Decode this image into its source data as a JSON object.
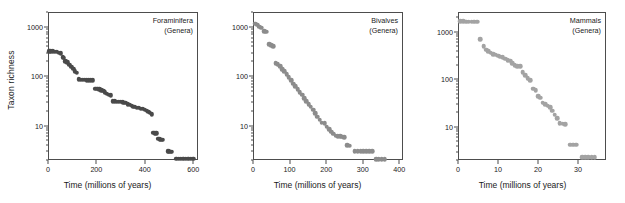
{
  "figure": {
    "shared_ylabel": "Taxon richness",
    "shared_xlabel": "Time (millions of years)"
  },
  "chart_data": [
    {
      "type": "scatter",
      "title": "Foraminifera",
      "subtitle": "(Genera)",
      "xlabel": "Time (millions of years)",
      "ylabel": "Taxon richness",
      "yscale": "log",
      "ylim": [
        2,
        2000
      ],
      "xlim": [
        0,
        620
      ],
      "yticks": [
        10,
        100,
        1000
      ],
      "ytick_labels": [
        "10",
        "100",
        "1000"
      ],
      "xticks": [
        0,
        200,
        400,
        600
      ],
      "xtick_labels": [
        "0",
        "200",
        "400",
        "600"
      ],
      "grid": false,
      "legend": "none",
      "marker_color": "#4a4a4a",
      "points": [
        [
          5,
          320
        ],
        [
          12,
          320
        ],
        [
          20,
          318
        ],
        [
          28,
          315
        ],
        [
          36,
          310
        ],
        [
          44,
          300
        ],
        [
          52,
          290
        ],
        [
          60,
          240
        ],
        [
          66,
          238
        ],
        [
          72,
          200
        ],
        [
          80,
          190
        ],
        [
          88,
          170
        ],
        [
          96,
          155
        ],
        [
          104,
          140
        ],
        [
          112,
          125
        ],
        [
          120,
          118
        ],
        [
          128,
          86
        ],
        [
          136,
          85
        ],
        [
          144,
          84
        ],
        [
          152,
          84
        ],
        [
          160,
          83
        ],
        [
          168,
          83
        ],
        [
          176,
          82
        ],
        [
          184,
          82
        ],
        [
          196,
          56
        ],
        [
          204,
          55
        ],
        [
          212,
          54
        ],
        [
          220,
          52
        ],
        [
          228,
          50
        ],
        [
          236,
          47
        ],
        [
          244,
          44
        ],
        [
          252,
          42
        ],
        [
          260,
          41
        ],
        [
          268,
          31
        ],
        [
          276,
          31
        ],
        [
          284,
          30
        ],
        [
          292,
          30
        ],
        [
          300,
          30
        ],
        [
          308,
          30
        ],
        [
          312,
          29
        ],
        [
          320,
          29
        ],
        [
          330,
          27
        ],
        [
          338,
          26
        ],
        [
          346,
          25
        ],
        [
          352,
          24
        ],
        [
          360,
          24
        ],
        [
          368,
          23
        ],
        [
          376,
          23
        ],
        [
          384,
          22
        ],
        [
          392,
          22
        ],
        [
          400,
          21
        ],
        [
          408,
          20
        ],
        [
          414,
          19
        ],
        [
          420,
          18
        ],
        [
          428,
          17
        ],
        [
          436,
          7.1
        ],
        [
          442,
          7.0
        ],
        [
          448,
          6.9
        ],
        [
          456,
          5.4
        ],
        [
          462,
          5.3
        ],
        [
          468,
          5.2
        ],
        [
          474,
          5.1
        ],
        [
          494,
          3.0
        ],
        [
          500,
          3.0
        ],
        [
          506,
          2.9
        ],
        [
          512,
          2.9
        ],
        [
          530,
          2.1
        ],
        [
          540,
          2.1
        ],
        [
          550,
          2.1
        ],
        [
          560,
          2.1
        ],
        [
          570,
          2.1
        ],
        [
          580,
          2.1
        ],
        [
          590,
          2.1
        ],
        [
          600,
          2.1
        ]
      ]
    },
    {
      "type": "scatter",
      "title": "Bivalves",
      "subtitle": "(Genera)",
      "xlabel": "Time (millions of years)",
      "ylabel": "Taxon richness",
      "yscale": "log",
      "ylim": [
        2,
        2000
      ],
      "xlim": [
        0,
        410
      ],
      "yticks": [
        10,
        100,
        1000
      ],
      "ytick_labels": [
        "10",
        "100",
        "1000"
      ],
      "xticks": [
        0,
        100,
        200,
        300,
        400
      ],
      "xtick_labels": [
        "0",
        "100",
        "200",
        "300",
        "400"
      ],
      "grid": false,
      "legend": "none",
      "marker_color": "#8c8c8c",
      "points": [
        [
          6,
          1150
        ],
        [
          12,
          1100
        ],
        [
          17,
          1000
        ],
        [
          22,
          960
        ],
        [
          30,
          820
        ],
        [
          36,
          790
        ],
        [
          45,
          450
        ],
        [
          50,
          430
        ],
        [
          56,
          410
        ],
        [
          62,
          185
        ],
        [
          68,
          175
        ],
        [
          74,
          160
        ],
        [
          80,
          140
        ],
        [
          86,
          125
        ],
        [
          92,
          110
        ],
        [
          98,
          95
        ],
        [
          104,
          82
        ],
        [
          110,
          70
        ],
        [
          116,
          62
        ],
        [
          122,
          55
        ],
        [
          128,
          48
        ],
        [
          134,
          42
        ],
        [
          140,
          36
        ],
        [
          146,
          31
        ],
        [
          152,
          27
        ],
        [
          158,
          24
        ],
        [
          164,
          21
        ],
        [
          170,
          18
        ],
        [
          176,
          15
        ],
        [
          182,
          13
        ],
        [
          188,
          11.5
        ],
        [
          196,
          11.0
        ],
        [
          202,
          9.5
        ],
        [
          208,
          8.5
        ],
        [
          214,
          7.5
        ],
        [
          220,
          6.8
        ],
        [
          226,
          6.2
        ],
        [
          232,
          6.0
        ],
        [
          238,
          6.0
        ],
        [
          244,
          5.9
        ],
        [
          250,
          5.8
        ],
        [
          258,
          4.0
        ],
        [
          264,
          3.9
        ],
        [
          278,
          3.0
        ],
        [
          286,
          3.0
        ],
        [
          294,
          3.0
        ],
        [
          302,
          3.0
        ],
        [
          310,
          3.0
        ],
        [
          318,
          3.0
        ],
        [
          326,
          3.0
        ],
        [
          336,
          2.1
        ],
        [
          344,
          2.1
        ],
        [
          352,
          2.1
        ],
        [
          360,
          2.1
        ]
      ]
    },
    {
      "type": "scatter",
      "title": "Mammals",
      "subtitle": "(Genera)",
      "xlabel": "Time (millions of years)",
      "ylabel": "Taxon richness",
      "yscale": "log",
      "ylim": [
        2,
        2600
      ],
      "xlim": [
        0,
        37
      ],
      "yticks": [
        10,
        100,
        1000
      ],
      "ytick_labels": [
        "10",
        "100",
        "1000"
      ],
      "xticks": [
        0,
        10,
        20,
        30
      ],
      "xtick_labels": [
        "0",
        "10",
        "20",
        "30"
      ],
      "grid": false,
      "legend": "none",
      "marker_color": "#a3a3a3",
      "points": [
        [
          0.6,
          1650
        ],
        [
          1.3,
          1650
        ],
        [
          2.0,
          1640
        ],
        [
          2.7,
          1640
        ],
        [
          3.4,
          1630
        ],
        [
          4.1,
          1630
        ],
        [
          4.8,
          1620
        ],
        [
          5.6,
          700
        ],
        [
          6.4,
          490
        ],
        [
          7.0,
          420
        ],
        [
          7.6,
          390
        ],
        [
          8.2,
          360
        ],
        [
          8.8,
          340
        ],
        [
          9.4,
          330
        ],
        [
          10.0,
          310
        ],
        [
          10.6,
          300
        ],
        [
          11.2,
          290
        ],
        [
          11.8,
          270
        ],
        [
          12.4,
          255
        ],
        [
          13.0,
          245
        ],
        [
          13.6,
          215
        ],
        [
          14.2,
          200
        ],
        [
          14.8,
          190
        ],
        [
          15.6,
          190
        ],
        [
          16.2,
          140
        ],
        [
          16.8,
          120
        ],
        [
          17.4,
          105
        ],
        [
          18.0,
          95
        ],
        [
          18.8,
          63
        ],
        [
          19.4,
          58
        ],
        [
          20.0,
          44
        ],
        [
          20.6,
          41
        ],
        [
          21.2,
          32
        ],
        [
          21.8,
          30
        ],
        [
          22.4,
          28
        ],
        [
          23.0,
          26
        ],
        [
          23.6,
          22
        ],
        [
          24.2,
          18
        ],
        [
          24.8,
          15
        ],
        [
          25.4,
          12
        ],
        [
          26.2,
          11.5
        ],
        [
          26.8,
          11.4
        ],
        [
          28.0,
          4.2
        ],
        [
          28.8,
          4.2
        ],
        [
          29.6,
          4.2
        ],
        [
          31.0,
          2.3
        ],
        [
          31.8,
          2.3
        ],
        [
          32.6,
          2.3
        ],
        [
          33.4,
          2.3
        ],
        [
          34.2,
          2.3
        ]
      ]
    }
  ]
}
